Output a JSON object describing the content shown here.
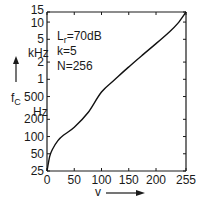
{
  "chart_data": {
    "type": "line",
    "title": "",
    "xlabel": "v",
    "ylabel": "f_C",
    "y_units_upper": "kHz",
    "y_units_lower": "Hz",
    "yscale": "log",
    "xlim": [
      0,
      255
    ],
    "ylim": [
      25,
      15000
    ],
    "grid": false,
    "x_ticks": [
      0,
      50,
      100,
      150,
      200,
      255
    ],
    "x_tick_labels": [
      "0",
      "50",
      "100",
      "150",
      "200",
      "255"
    ],
    "y_ticks": [
      25,
      50,
      100,
      200,
      500,
      1000,
      2000,
      5000,
      10000,
      15000
    ],
    "y_tick_labels": [
      "25",
      "50",
      "100",
      "200",
      "500",
      "1",
      "2",
      "5",
      "10",
      "15"
    ],
    "annotations": [
      "L_r=70dB",
      "k=5",
      "N=256"
    ],
    "series": [
      {
        "name": "f_C(v)",
        "x": [
          0,
          5,
          10,
          20,
          30,
          50,
          75,
          100,
          125,
          150,
          175,
          200,
          225,
          240,
          255
        ],
        "y": [
          25,
          45,
          60,
          85,
          105,
          145,
          260,
          600,
          1000,
          1650,
          2650,
          4200,
          6800,
          9500,
          15000
        ]
      }
    ]
  },
  "labels": {
    "y_top_units": "kHz",
    "y_bottom_units": "Hz",
    "y_symbol": "f",
    "y_symbol_sub": "C",
    "x_symbol": "v",
    "param_lr": "L",
    "param_lr_sub": "r",
    "param_lr_val": "=70dB",
    "param_k": "k=5",
    "param_n": "N=256"
  }
}
